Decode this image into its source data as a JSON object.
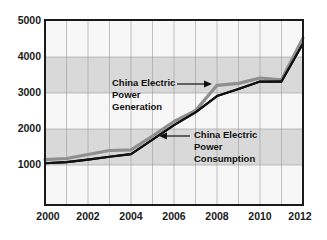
{
  "chart_data": {
    "type": "line",
    "title": "",
    "subtitle": "",
    "xlabel": "",
    "ylabel": "",
    "x": [
      2000,
      2001,
      2002,
      2003,
      2004,
      2005,
      2006,
      2007,
      2008,
      2009,
      2010,
      2011,
      2012
    ],
    "xlim": [
      2000,
      2012
    ],
    "ylim": [
      0,
      5000
    ],
    "grid": true,
    "legend_position": "annotations-inline",
    "xtick_labels": [
      "2000",
      "2002",
      "2004",
      "2006",
      "2008",
      "2010",
      "2012"
    ],
    "xtick_values": [
      2000,
      2002,
      2004,
      2006,
      2008,
      2010,
      2012
    ],
    "ytick_labels": [
      "1000",
      "2000",
      "3000",
      "4000",
      "5000"
    ],
    "ytick_values": [
      1000,
      2000,
      3000,
      4000,
      5000
    ],
    "series": [
      {
        "name": "China Electric Power Generation",
        "color": "#8f8f8f",
        "values": [
          1150,
          1180,
          1290,
          1400,
          1420,
          1800,
          2200,
          2500,
          3200,
          3250,
          3400,
          3350,
          4500
        ]
      },
      {
        "name": "China Electric Power Consumption",
        "color": "#111111",
        "values": [
          1050,
          1080,
          1150,
          1230,
          1300,
          1700,
          2100,
          2450,
          2900,
          3100,
          3300,
          3300,
          4350
        ]
      }
    ],
    "annotations": [
      {
        "id": "generation",
        "lines": [
          "China Electric",
          "Power",
          "Generation"
        ],
        "arrow_direction": "right",
        "points_to_year": 2008
      },
      {
        "id": "consumption",
        "lines": [
          "China Electric",
          "Power",
          "Consumption"
        ],
        "arrow_direction": "left",
        "points_to_year": 2006
      }
    ],
    "colors": {
      "generation": "#8f8f8f",
      "consumption": "#111111",
      "band_shaded": "#d9d9d9",
      "band_plain": "#f7f7f7",
      "gridline": "#9a9a9a",
      "axis": "#1a1a1a",
      "background": "#ffffff"
    }
  }
}
